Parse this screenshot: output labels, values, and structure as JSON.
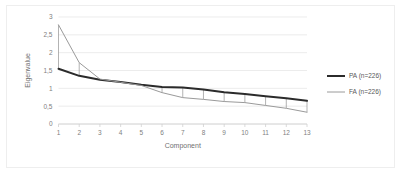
{
  "chart_data": {
    "type": "line",
    "title": "",
    "xlabel": "Component",
    "ylabel": "Eigenvalue",
    "x": [
      1,
      2,
      3,
      4,
      5,
      6,
      7,
      8,
      9,
      10,
      11,
      12,
      13
    ],
    "xtick_labels": [
      "1",
      "2",
      "3",
      "4",
      "5",
      "6",
      "7",
      "8",
      "9",
      "10",
      "11",
      "12",
      "13"
    ],
    "ytick_labels": [
      "0",
      "0,5",
      "1",
      "1,5",
      "2",
      "2,5",
      "3"
    ],
    "ytick_values": [
      0,
      0.5,
      1,
      1.5,
      2,
      2.5,
      3
    ],
    "ylim": [
      0,
      3
    ],
    "xlim": [
      1,
      13
    ],
    "grid": "horizontal",
    "legend_position": "right",
    "series": [
      {
        "name": "PA (n=226)",
        "color": "#2b2b2b",
        "width": "thick",
        "values": [
          1.55,
          1.35,
          1.24,
          1.18,
          1.1,
          1.04,
          1.02,
          0.97,
          0.89,
          0.84,
          0.78,
          0.72,
          0.65
        ]
      },
      {
        "name": "FA (n=226)",
        "color": "#9a9a9a",
        "width": "thin",
        "values": [
          2.78,
          1.72,
          1.26,
          1.17,
          1.08,
          0.88,
          0.74,
          0.69,
          0.63,
          0.6,
          0.52,
          0.44,
          0.33
        ]
      }
    ],
    "connectors_at": [
      1,
      2,
      6,
      7,
      8,
      9,
      10,
      11,
      12,
      13
    ]
  },
  "legend": {
    "items": [
      {
        "label": "PA (n=226)",
        "color": "#2b2b2b"
      },
      {
        "label": "FA (n=226)",
        "color": "#9a9a9a"
      }
    ]
  },
  "colors": {
    "pa": "#2b2b2b",
    "fa": "#9a9a9a",
    "grid": "#e4e4e4",
    "text": "#808080",
    "border": "#eeeeee",
    "background": "#ffffff"
  }
}
